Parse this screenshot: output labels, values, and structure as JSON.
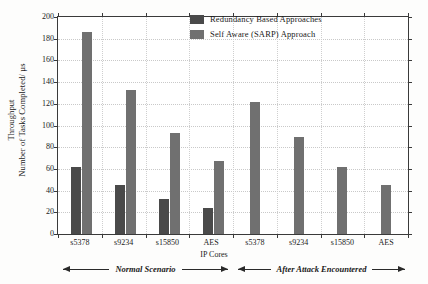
{
  "chart_data": {
    "type": "bar",
    "title": "",
    "xlabel": "IP Cores",
    "ylabel_line1": "Throughput",
    "ylabel_line2": "Number of Tasks Completed/ µs",
    "ylim": [
      0,
      200
    ],
    "ytick_step": 20,
    "yticks": [
      0,
      20,
      40,
      60,
      80,
      100,
      120,
      140,
      160,
      180,
      200
    ],
    "grid": true,
    "legend_position": "top-right-inside",
    "categories": [
      "s5378",
      "s9234",
      "s15850",
      "AES",
      "s5378",
      "s9234",
      "s15850",
      "AES"
    ],
    "series": [
      {
        "name": "Redundancy Based Approaches",
        "color": "#4a4a4a",
        "values": [
          62,
          45,
          32,
          24,
          null,
          null,
          null,
          null
        ]
      },
      {
        "name": "Self Aware (SARP) Approach",
        "color": "#707070",
        "values": [
          186,
          133,
          93,
          67,
          122,
          89,
          62,
          45
        ]
      }
    ],
    "annotations": [
      {
        "text": "Normal Scenario",
        "span_categories": [
          "s5378",
          "AES"
        ],
        "group": "left",
        "arrows": "both"
      },
      {
        "text": "After Attack Encountered",
        "span_categories": [
          "s5378",
          "AES"
        ],
        "group": "right",
        "arrows": "both"
      }
    ]
  },
  "legend": {
    "items": [
      {
        "label": "Redundancy Based Approaches",
        "color": "#4a4a4a"
      },
      {
        "label": "Self Aware (SARP) Approach",
        "color": "#707070"
      }
    ]
  },
  "axes": {
    "y_title_line1": "Throughput",
    "y_title_line2": "Number of Tasks Completed/ µs",
    "x_title": "IP Cores",
    "ytick_labels": [
      "200",
      "180",
      "160",
      "140",
      "120",
      "100",
      "80",
      "60",
      "40",
      "20",
      "0"
    ],
    "xtick_labels": [
      "s5378",
      "s9234",
      "s15850",
      "AES",
      "s5378",
      "s9234",
      "s15850",
      "AES"
    ]
  },
  "annotations": {
    "left_scenario": "Normal Scenario",
    "right_scenario": "After Attack Encountered"
  }
}
